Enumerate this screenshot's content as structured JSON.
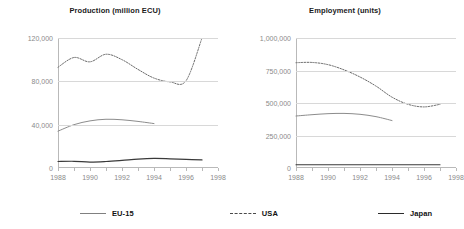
{
  "chart_data": [
    {
      "type": "line",
      "title": "Production (million ECU)",
      "xlabel": "",
      "ylabel": "",
      "x": [
        1988,
        1989,
        1990,
        1991,
        1992,
        1993,
        1994,
        1995,
        1996,
        1997
      ],
      "xlim": [
        1988,
        1998
      ],
      "ylim": [
        0,
        120000
      ],
      "yticks": [
        0,
        40000,
        80000,
        120000
      ],
      "ytick_labels": [
        "0",
        "40,000",
        "80,000",
        "120,000"
      ],
      "xticks": [
        1988,
        1990,
        1992,
        1994,
        1996,
        1998
      ],
      "xtick_labels": [
        "1988",
        "1990",
        "1992",
        "1994",
        "1996",
        "1998"
      ],
      "grid": true,
      "legend_position": "below",
      "series": [
        {
          "name": "EU-15",
          "style": "solid",
          "color": "#8c8c8c",
          "x": [
            1988,
            1989,
            1990,
            1991,
            1992,
            1993,
            1994
          ],
          "values": [
            34000,
            40000,
            43500,
            45000,
            44500,
            43000,
            41000
          ]
        },
        {
          "name": "USA",
          "style": "dotted",
          "color": "#6b6b6b",
          "x": [
            1988,
            1989,
            1990,
            1991,
            1992,
            1993,
            1994,
            1995,
            1996,
            1997
          ],
          "values": [
            93000,
            102000,
            98000,
            105000,
            100000,
            91000,
            83000,
            79500,
            80500,
            120000
          ]
        },
        {
          "name": "Japan",
          "style": "solid",
          "color": "#3a3a3a",
          "x": [
            1988,
            1989,
            1990,
            1991,
            1992,
            1993,
            1994,
            1995,
            1996,
            1997
          ],
          "values": [
            6000,
            6200,
            5500,
            6000,
            7000,
            8200,
            8800,
            8500,
            8000,
            7500
          ]
        }
      ]
    },
    {
      "type": "line",
      "title": "Employment (units)",
      "xlabel": "",
      "ylabel": "",
      "x": [
        1988,
        1989,
        1990,
        1991,
        1992,
        1993,
        1994,
        1995,
        1996,
        1997
      ],
      "xlim": [
        1988,
        1998
      ],
      "ylim": [
        0,
        1000000
      ],
      "yticks": [
        0,
        250000,
        500000,
        750000,
        1000000
      ],
      "ytick_labels": [
        "0",
        "250,000",
        "500,000",
        "750,000",
        "1,000,000"
      ],
      "xticks": [
        1988,
        1990,
        1992,
        1994,
        1996,
        1998
      ],
      "xtick_labels": [
        "1988",
        "1990",
        "1992",
        "1994",
        "1996",
        "1998"
      ],
      "grid": true,
      "legend_position": "below",
      "series": [
        {
          "name": "EU-15",
          "style": "solid",
          "color": "#8c8c8c",
          "x": [
            1988,
            1989,
            1990,
            1991,
            1992,
            1993,
            1994
          ],
          "values": [
            400000,
            410000,
            418000,
            420000,
            413000,
            395000,
            365000
          ]
        },
        {
          "name": "USA",
          "style": "dotted",
          "color": "#6b6b6b",
          "x": [
            1988,
            1989,
            1990,
            1991,
            1992,
            1993,
            1994,
            1995,
            1996,
            1997
          ],
          "values": [
            810000,
            812000,
            795000,
            755000,
            700000,
            630000,
            545000,
            490000,
            470000,
            490000
          ]
        },
        {
          "name": "Japan",
          "style": "solid",
          "color": "#3a3a3a",
          "x": [
            1988,
            1989,
            1990,
            1991,
            1992,
            1993,
            1994,
            1995,
            1996,
            1997
          ],
          "values": [
            25000,
            25000,
            25000,
            25000,
            25000,
            25000,
            25000,
            25000,
            25000,
            25000
          ]
        }
      ]
    }
  ],
  "legend": {
    "items": [
      {
        "label": "EU-15",
        "style": "solid"
      },
      {
        "label": "USA",
        "style": "dashed"
      },
      {
        "label": "Japan",
        "style": "solid"
      }
    ]
  }
}
